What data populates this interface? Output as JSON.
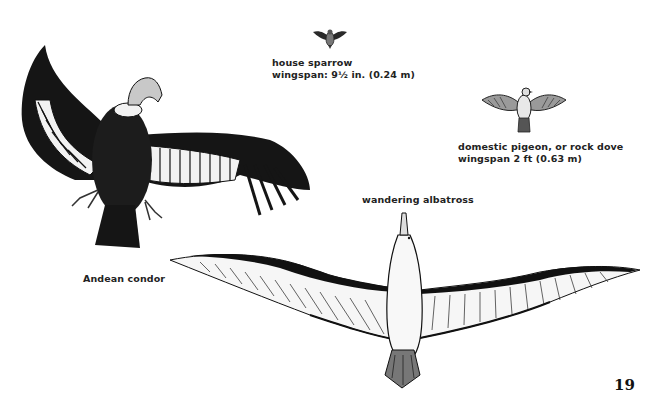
{
  "page": {
    "page_number": "19",
    "birds": [
      {
        "name": "house sparrow",
        "wingspan": "wingspan: 9½ in. (0.24 m)",
        "icon": "sparrow-illustration"
      },
      {
        "name": "domestic pigeon, or rock dove",
        "wingspan": "wingspan 2 ft (0.63 m)",
        "icon": "pigeon-illustration"
      },
      {
        "name": "wandering albatross",
        "icon": "albatross-illustration"
      },
      {
        "name": "Andean condor",
        "icon": "condor-illustration"
      }
    ],
    "colors": {
      "background": "#ffffff",
      "ink": "#1a1a1a",
      "feather_white": "#f4f4f4",
      "condor_head": "#c8c8c8"
    }
  }
}
